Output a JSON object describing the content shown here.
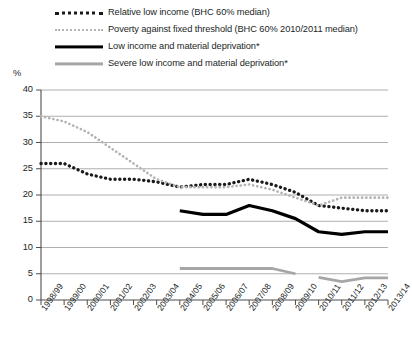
{
  "chart_data": {
    "type": "line",
    "title": "",
    "xlabel": "",
    "ylabel": "%",
    "ylim": [
      0,
      40
    ],
    "ytick_step": 5,
    "yticks": [
      "40",
      "35",
      "30",
      "25",
      "20",
      "15",
      "10",
      "5",
      "0"
    ],
    "grid": "horizontal",
    "legend_position": "top",
    "categories": [
      "1998/99",
      "1999/00",
      "2000/01",
      "2001/02",
      "2002/03",
      "2003/04",
      "2004/05",
      "2005/06",
      "2006/07",
      "2007/08",
      "2008/09",
      "2009/10",
      "2010/11",
      "2011/12",
      "2012/13",
      "2013/14"
    ],
    "series": [
      {
        "name": "Relative low income (BHC 60% median)",
        "style": "dotted",
        "color": "#1a1a1a",
        "values": [
          26,
          26,
          24,
          23,
          23,
          22.5,
          21.5,
          22,
          22,
          23,
          22,
          20.5,
          18,
          17.5,
          17,
          17
        ]
      },
      {
        "name": "Poverty against fixed threshold (BHC 60% 2010/2011 median)",
        "style": "dotted",
        "color": "#b3b3b3",
        "values": [
          35,
          34,
          32,
          29,
          26,
          23,
          21.5,
          21.5,
          21.5,
          22,
          21,
          19.5,
          18,
          19.5,
          19.5,
          19.5
        ]
      },
      {
        "name": "Low income and material deprivation*",
        "style": "solid",
        "color": "#000000",
        "values": [
          null,
          null,
          null,
          null,
          null,
          null,
          17,
          16.3,
          16.3,
          18,
          17,
          15.5,
          13,
          12.5,
          13,
          13
        ]
      },
      {
        "name": "Severe low income and material deprivation*",
        "style": "solid",
        "color": "#a6a6a6",
        "values": [
          null,
          null,
          null,
          null,
          null,
          null,
          6,
          6,
          6,
          6,
          6,
          5,
          4.3,
          3.5,
          4.2,
          4.2
        ]
      }
    ]
  }
}
